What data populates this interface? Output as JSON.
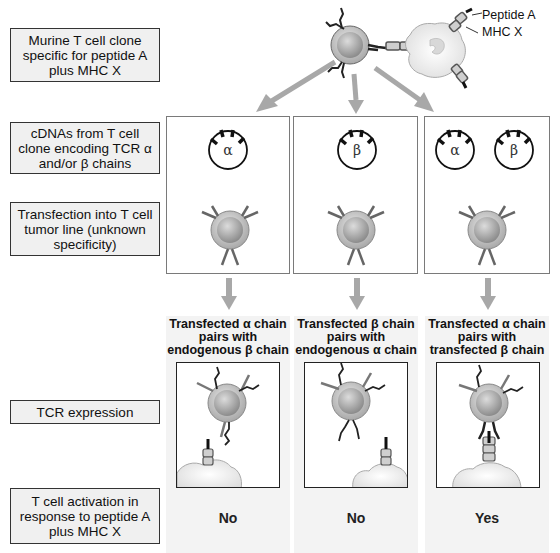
{
  "row_labels": {
    "clone": "Murine T cell clone specific for peptide A plus MHC X",
    "cdnas": "cDNAs from T cell clone encoding TCR α and/or β chains",
    "transfection": "Transfection into T cell tumor line (unknown specificity)",
    "expression": "TCR expression",
    "activation": "T cell activation in response to peptide A plus MHC X"
  },
  "top_annotations": {
    "peptide": "Peptide A",
    "mhc": "MHC X"
  },
  "columns": [
    {
      "plasmids": [
        "α"
      ],
      "result_title": "Transfected α chain pairs with endogenous β chain",
      "answer": "No"
    },
    {
      "plasmids": [
        "β"
      ],
      "result_title": "Transfected β chain pairs with endogenous α chain",
      "answer": "No"
    },
    {
      "plasmids": [
        "α",
        "β"
      ],
      "result_title": "Transfected α chain pairs with transfected β chain",
      "answer": "Yes"
    }
  ],
  "colors": {
    "arrow": "#a8a8a8",
    "panel_border": "#7a7a7a",
    "label_bg": "#f0f0f0",
    "shade_bg": "#f3f3f3"
  }
}
